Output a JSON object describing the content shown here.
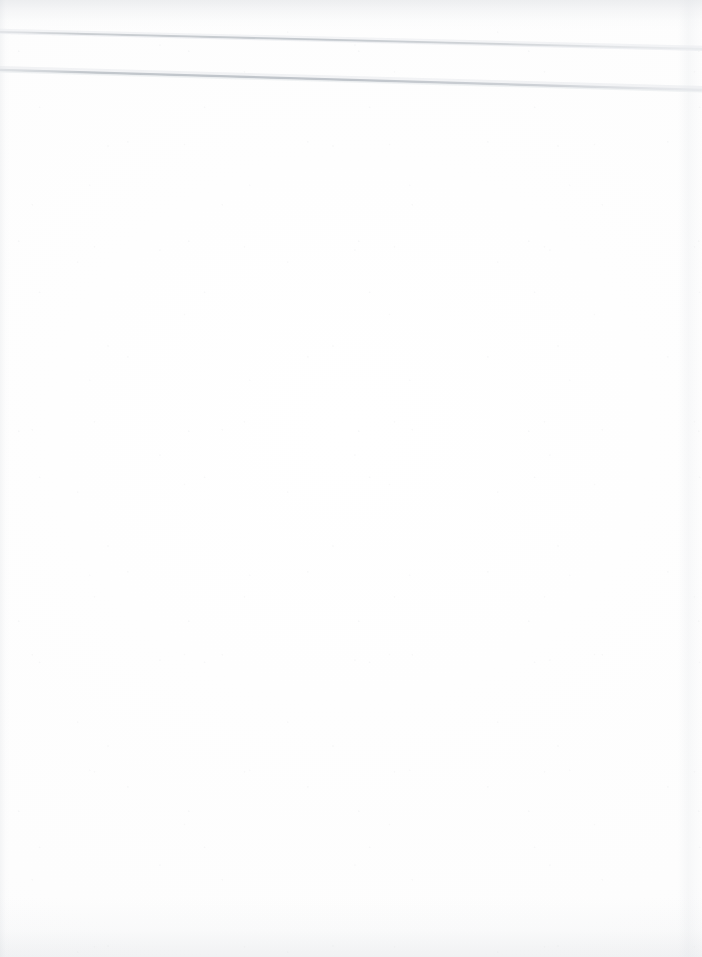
{
  "document": {
    "kind": "scanned-page",
    "title": "Blank scanned page",
    "page_width": 702,
    "page_height": 957,
    "background_color": "#ffffff",
    "has_text": false,
    "body_text": "",
    "description": "An essentially blank white scanned page with two faint light-grey diagonal scan lines crossing the upper area, plus subtle grey shading along the top, bottom and right edges."
  },
  "artifacts": {
    "line_color": "#c8ccd0",
    "line_color_soft": "#dfe2e6",
    "edge_shadow_color": "#c6cad0",
    "marks": [
      {
        "name": "upper-scan-line",
        "type": "diagonal-line",
        "x1": 0,
        "y1": 32,
        "x2": 702,
        "y2": 49,
        "thickness": 2.2,
        "color": "#c8ccd0"
      },
      {
        "name": "lower-scan-line",
        "type": "diagonal-line",
        "x1": 0,
        "y1": 70,
        "x2": 702,
        "y2": 90,
        "thickness": 2.6,
        "color": "#c2c7cc"
      }
    ],
    "edges": [
      {
        "name": "top-edge-shading",
        "side": "top",
        "extent": 30
      },
      {
        "name": "bottom-edge-shading",
        "side": "bottom",
        "extent": 60
      },
      {
        "name": "left-edge-shading",
        "side": "left",
        "extent": 10
      },
      {
        "name": "right-edge-band",
        "side": "right",
        "extent": 24
      }
    ]
  }
}
